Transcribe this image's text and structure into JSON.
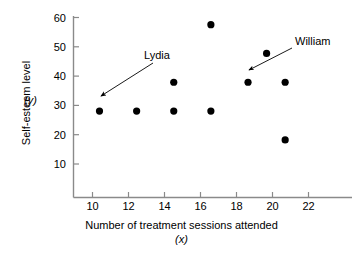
{
  "chart_data": {
    "type": "scatter",
    "title": "",
    "xlabel": "Number of treatment sessions attended",
    "xlabel_symbol": "(x)",
    "ylabel": "Self-esteem level",
    "ylabel_symbol": "(y)",
    "xlim": [
      8.6,
      23.6
    ],
    "ylim": [
      0,
      63
    ],
    "xticks": [
      10,
      12,
      14,
      16,
      18,
      20,
      22
    ],
    "yticks": [
      10,
      20,
      30,
      40,
      50,
      60
    ],
    "xtick_labels": [
      "10",
      "12",
      "14",
      "16",
      "18",
      "20",
      "22"
    ],
    "ytick_labels": [
      "10",
      "20",
      "30",
      "40",
      "50",
      "60"
    ],
    "grid": false,
    "legend": "none",
    "marker": "filled-circle",
    "marker_color": "#000000",
    "points": [
      {
        "x": 10,
        "y": 30
      },
      {
        "x": 12,
        "y": 30
      },
      {
        "x": 14,
        "y": 30
      },
      {
        "x": 14,
        "y": 40
      },
      {
        "x": 16,
        "y": 30
      },
      {
        "x": 16,
        "y": 60
      },
      {
        "x": 18,
        "y": 40
      },
      {
        "x": 19,
        "y": 50
      },
      {
        "x": 20,
        "y": 40
      },
      {
        "x": 20,
        "y": 20
      }
    ],
    "annotations": [
      {
        "label": "Lydia",
        "points_to": {
          "x": 10,
          "y": 30
        }
      },
      {
        "label": "William",
        "points_to": {
          "x": 18,
          "y": 40
        }
      }
    ]
  },
  "axis": {
    "y_tick_0": "60",
    "y_tick_1": "50",
    "y_tick_2": "40",
    "y_tick_3": "30",
    "y_tick_4": "20",
    "y_tick_5": "10",
    "x_tick_0": "10",
    "x_tick_1": "12",
    "x_tick_2": "14",
    "x_tick_3": "16",
    "x_tick_4": "18",
    "x_tick_5": "20",
    "x_tick_6": "22",
    "y_title": "Self-esteem level",
    "y_symbol": "(y)",
    "x_title": "Number of treatment sessions attended",
    "x_symbol": "(x)"
  },
  "annotations": {
    "lydia_label": "Lydia",
    "william_label": "William"
  },
  "colors": {
    "axis": "#8a8a8a",
    "marker": "#000000",
    "text": "#000000",
    "background": "#ffffff"
  }
}
